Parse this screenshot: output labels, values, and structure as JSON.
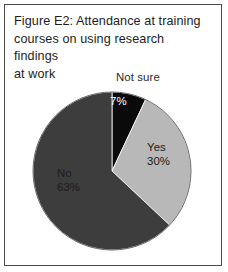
{
  "figure": {
    "title": "Figure E2: Attendance at training courses on using research findings at work",
    "title_lines": [
      "Figure E2: Attendance at training",
      "courses on using research findings",
      "at work"
    ],
    "border_color": "#4a4a4a",
    "background_color": "#ffffff"
  },
  "chart_data": {
    "type": "pie",
    "title": "Figure E2: Attendance at training courses on using research findings at work",
    "xlabel": "",
    "ylabel": "",
    "unit": "%",
    "start_angle_deg": 0,
    "direction": "clockwise",
    "legend_position": "none",
    "grid": false,
    "categories": [
      "Not sure",
      "Yes",
      "No"
    ],
    "values": [
      7,
      30,
      63
    ],
    "labels": [
      "7%",
      "30%",
      "63%"
    ],
    "colors": [
      "#0a0a0a",
      "#b8b8b8",
      "#3d3d3d"
    ],
    "label_text_colors": [
      "#ffffff",
      "#1c1c1c",
      "#1c1c1c"
    ],
    "slices": [
      {
        "name": "Not sure",
        "value": 7,
        "label": "7%",
        "color": "#0a0a0a",
        "start_deg": 0,
        "end_deg": 25.2,
        "label_placement": "outside-above"
      },
      {
        "name": "Yes",
        "value": 30,
        "label": "30%",
        "color": "#b8b8b8",
        "start_deg": 25.2,
        "end_deg": 133.2,
        "label_placement": "inside"
      },
      {
        "name": "No",
        "value": 63,
        "label": "63%",
        "color": "#3d3d3d",
        "start_deg": 133.2,
        "end_deg": 360,
        "label_placement": "inside"
      }
    ]
  },
  "geometry": {
    "center_x": 112,
    "center_y": 171,
    "radius": 79
  }
}
